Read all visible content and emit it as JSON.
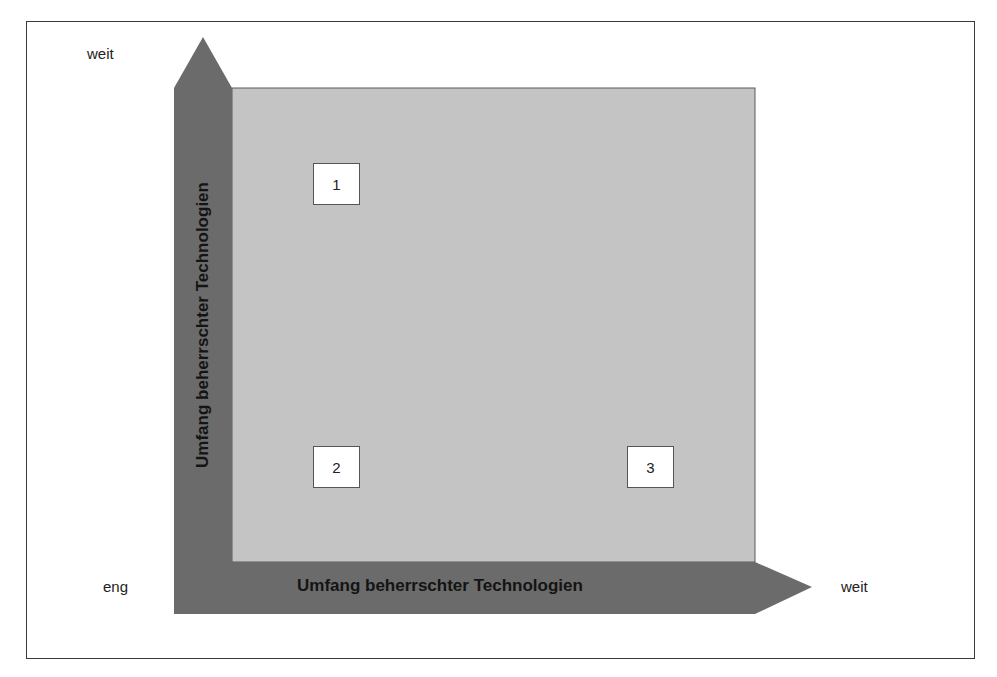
{
  "diagram": {
    "y_axis": {
      "title": "Umfang beherrschter Technologien",
      "high_label": "weit"
    },
    "x_axis": {
      "title": "Umfang beherrschter Technologien",
      "low_label": "eng",
      "high_label": "weit"
    },
    "quadrant_markers": [
      {
        "label": "1"
      },
      {
        "label": "2"
      },
      {
        "label": "3"
      }
    ],
    "colors": {
      "arrow_fill": "#6b6b6b",
      "field_fill": "#c4c4c4",
      "frame_border": "#3a3a3a",
      "marker_fill": "#ffffff"
    }
  }
}
